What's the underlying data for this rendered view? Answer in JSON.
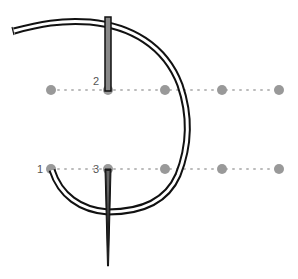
{
  "diagram": {
    "labels": [
      {
        "text": "2",
        "x": 93,
        "y": 76
      },
      {
        "text": "1",
        "x": 37,
        "y": 166
      },
      {
        "text": "3",
        "x": 93,
        "y": 166
      }
    ],
    "grid_rows": [
      {
        "y": 90,
        "points_x": [
          51,
          108,
          165,
          222,
          279
        ]
      },
      {
        "y": 169,
        "points_x": [
          51,
          108,
          165,
          222,
          279
        ]
      }
    ],
    "colors": {
      "dot": "#999999",
      "dotted_line": "#bbbbbb",
      "thread_outline": "#111111",
      "thread_fill": "#ffffff",
      "needle_fill": "#888888",
      "needle_outline": "#111111",
      "label": "#555555"
    }
  }
}
